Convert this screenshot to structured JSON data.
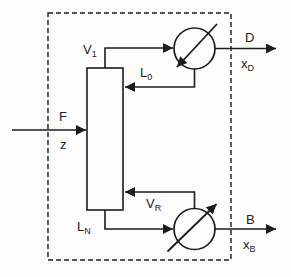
{
  "diagram": {
    "kind": "distillation-column-block-diagram",
    "boundary": "dashed-system-boundary",
    "labels": {
      "v1_base": "V",
      "v1_sub": "1",
      "l0_base": "L",
      "l0_sub": "0",
      "feed": "F",
      "feed_composition": "z",
      "vr_base": "V",
      "vr_sub": "R",
      "ln_base": "L",
      "ln_sub": "N",
      "distillate": "D",
      "xd_base": "x",
      "xd_sub": "D",
      "bottoms": "B",
      "xb_base": "x",
      "xb_sub": "B"
    },
    "colors": {
      "line": "#1c1c1c",
      "background": "#fcfcfc"
    }
  }
}
